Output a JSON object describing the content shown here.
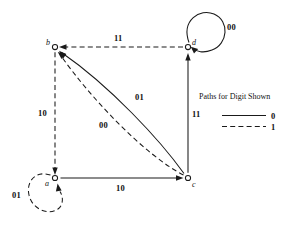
{
  "figure": {
    "type": "state-transition-diagram",
    "background": "#ffffff",
    "ink_color": "#1a1a1a"
  },
  "nodes": [
    {
      "id": "b",
      "label": "b",
      "x": 55,
      "y": 47
    },
    {
      "id": "d",
      "label": "d",
      "x": 188,
      "y": 47
    },
    {
      "id": "a",
      "label": "a",
      "x": 55,
      "y": 178
    },
    {
      "id": "c",
      "label": "c",
      "x": 188,
      "y": 178
    }
  ],
  "edges": [
    {
      "id": "d-to-b",
      "from": "d",
      "to": "b",
      "label": "11",
      "style": "dashed",
      "digit": "1"
    },
    {
      "id": "b-to-a",
      "from": "b",
      "to": "a",
      "label": "10",
      "style": "dashed",
      "digit": "1"
    },
    {
      "id": "a-to-c",
      "from": "a",
      "to": "c",
      "label": "10",
      "style": "solid",
      "digit": "0"
    },
    {
      "id": "c-to-d",
      "from": "c",
      "to": "d",
      "label": "11",
      "style": "solid",
      "digit": "0"
    },
    {
      "id": "c-to-b-solid",
      "from": "c",
      "to": "b",
      "label": "01",
      "style": "solid",
      "digit": "0"
    },
    {
      "id": "c-to-b-dashed",
      "from": "c",
      "to": "b",
      "label": "00",
      "style": "dashed",
      "digit": "1"
    },
    {
      "id": "d-self-loop",
      "from": "d",
      "to": "d",
      "label": "00",
      "style": "solid",
      "digit": "0"
    },
    {
      "id": "a-self-loop",
      "from": "a",
      "to": "a",
      "label": "01",
      "style": "dashed",
      "digit": "1"
    }
  ],
  "edge_labels": {
    "top": "11",
    "left": "10",
    "bottom": "10",
    "right": "11",
    "diagonal_solid": "01",
    "diagonal_dashed": "00",
    "loop_top_right": "00",
    "loop_bottom_left": "01"
  },
  "legend": {
    "title": "Paths for Digit Shown",
    "entries": [
      {
        "style": "solid",
        "label": "0"
      },
      {
        "style": "dashed",
        "label": "1"
      }
    ]
  }
}
